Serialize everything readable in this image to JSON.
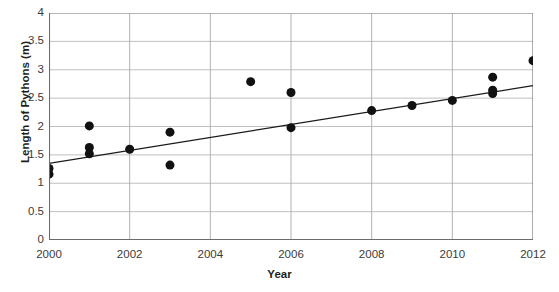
{
  "chart_data": {
    "type": "scatter",
    "title": "",
    "xlabel": "Year",
    "ylabel": "Length of Pythons (m)",
    "xlim": [
      2000,
      2012
    ],
    "ylim": [
      0,
      4
    ],
    "xticks": [
      2000,
      2002,
      2004,
      2006,
      2008,
      2010,
      2012
    ],
    "xticklabels": [
      "2000",
      "2002",
      "2004",
      "2006",
      "2008",
      "2010",
      "2012"
    ],
    "yticks": [
      0,
      0.5,
      1,
      1.5,
      2,
      2.5,
      3,
      3.5,
      4
    ],
    "yticklabels": [
      "0",
      "0.5",
      "1",
      "1.5",
      "2",
      "2.5",
      "3",
      "3.5",
      "4"
    ],
    "grid": "horizontal-and-vertical",
    "legend": "none",
    "marker": "filled-circle",
    "marker_color": "#111111",
    "marker_size": 9,
    "points": [
      {
        "x": 2000,
        "y": 1.26
      },
      {
        "x": 2000,
        "y": 1.16
      },
      {
        "x": 2001,
        "y": 2.01
      },
      {
        "x": 2001,
        "y": 1.63
      },
      {
        "x": 2001,
        "y": 1.52
      },
      {
        "x": 2002,
        "y": 1.6
      },
      {
        "x": 2003,
        "y": 1.9
      },
      {
        "x": 2003,
        "y": 1.32
      },
      {
        "x": 2005,
        "y": 2.79
      },
      {
        "x": 2006,
        "y": 2.6
      },
      {
        "x": 2006,
        "y": 1.98
      },
      {
        "x": 2008,
        "y": 2.28
      },
      {
        "x": 2009,
        "y": 2.37
      },
      {
        "x": 2010,
        "y": 2.46
      },
      {
        "x": 2011,
        "y": 2.87
      },
      {
        "x": 2011,
        "y": 2.64
      },
      {
        "x": 2011,
        "y": 2.58
      },
      {
        "x": 2012,
        "y": 3.16
      }
    ],
    "trendline": {
      "type": "linear",
      "color": "#1a1a1a",
      "x_start": 2000,
      "y_start": 1.35,
      "x_end": 2012,
      "y_end": 2.72
    }
  }
}
